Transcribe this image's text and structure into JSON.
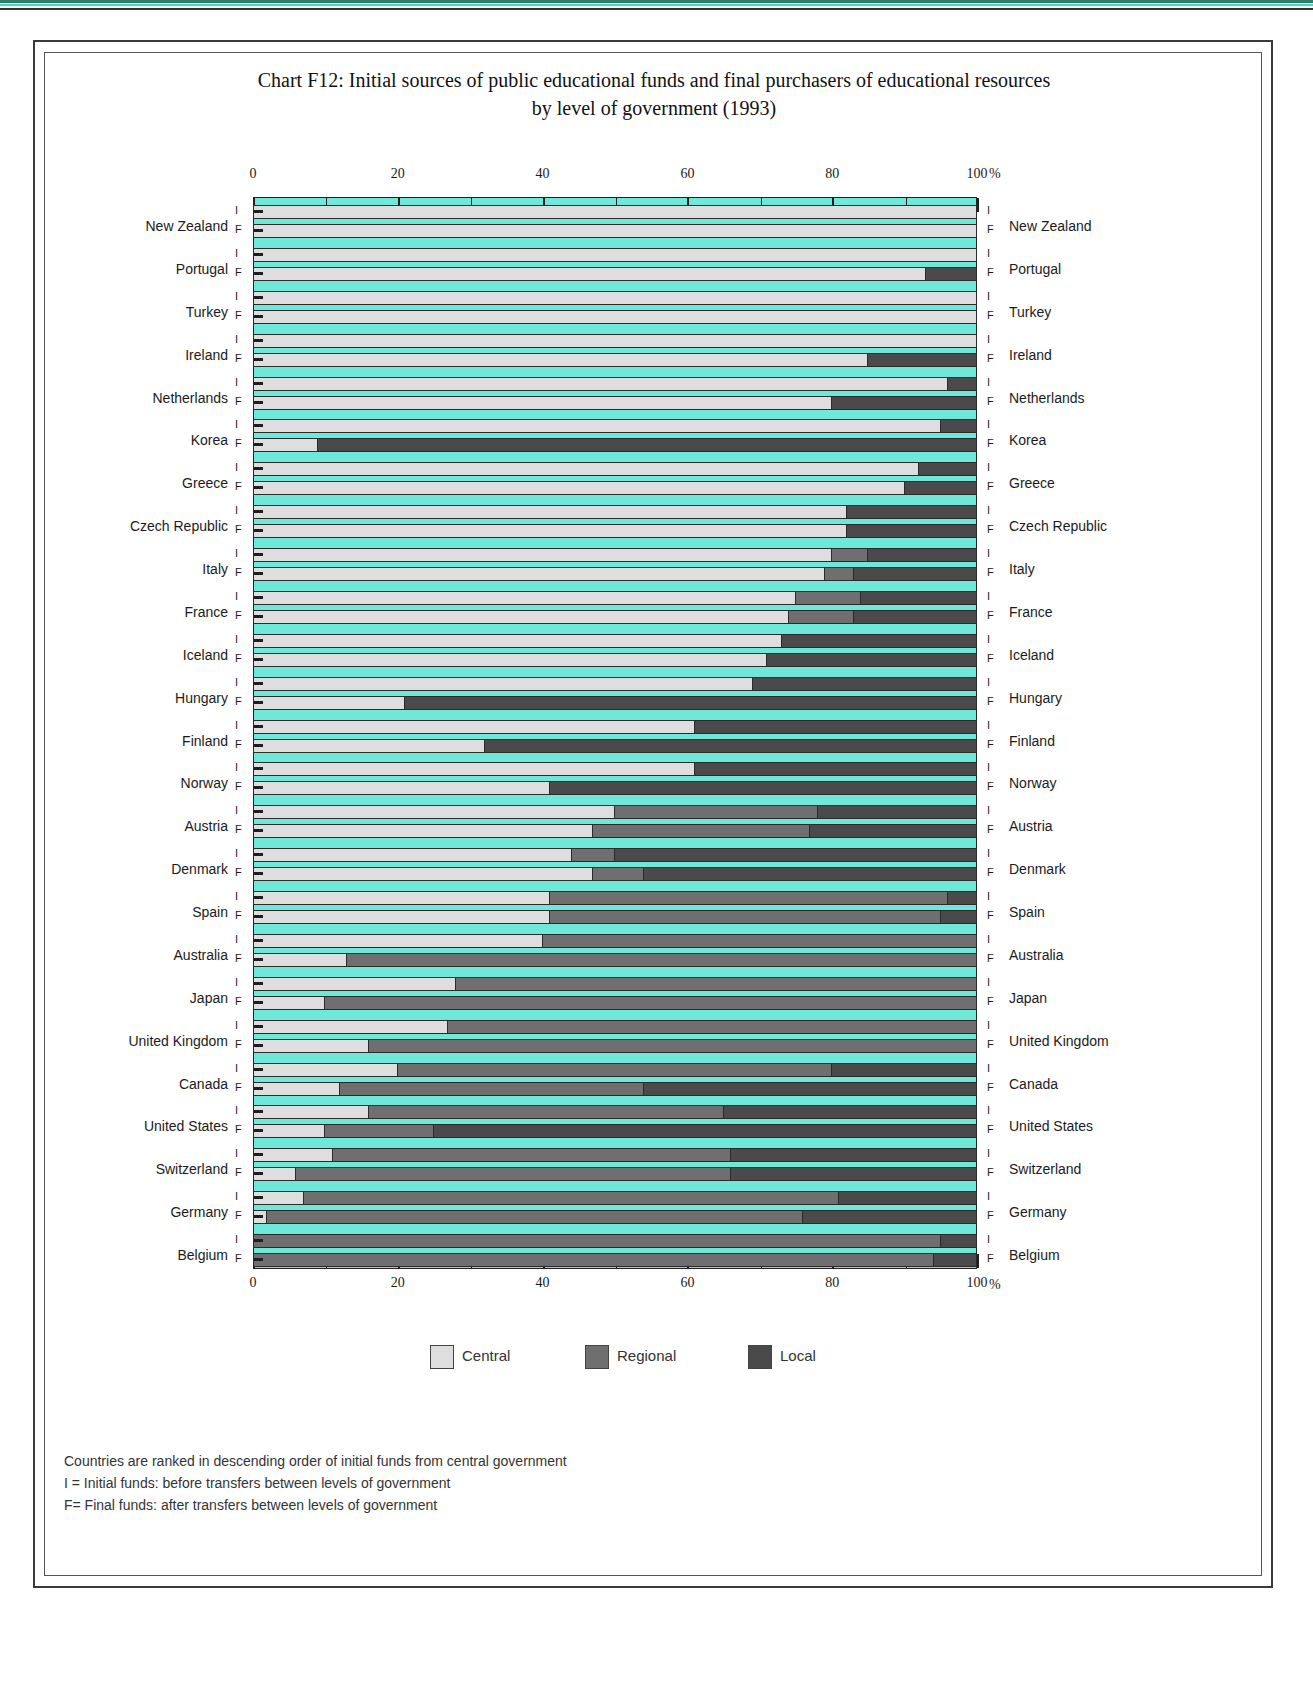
{
  "title_line1": "Chart F12: Initial sources of public educational funds and final purchasers of educational resources",
  "title_line2": "by level of government (1993)",
  "axis": {
    "ticks": [
      0,
      20,
      40,
      60,
      80,
      100
    ],
    "minor_ticks": [
      10,
      30,
      50,
      70,
      90
    ],
    "unit": "%",
    "min": 0,
    "max": 100
  },
  "legend": {
    "items": [
      {
        "label": "Central",
        "color": "#dedede"
      },
      {
        "label": "Regional",
        "color": "#6f6f6f"
      },
      {
        "label": "Local",
        "color": "#4a4a4a"
      }
    ]
  },
  "row_markers": {
    "initial": "I",
    "final": "F"
  },
  "notes": [
    "Countries are ranked in descending order of initial funds from central government",
    "I = Initial funds: before transfers between levels of government",
    "F= Final funds: after transfers between levels of government"
  ],
  "chart_data": {
    "type": "bar",
    "orientation": "horizontal",
    "stacked": true,
    "title": "Chart F12: Initial sources of public educational funds and final purchasers of educational resources by level of government (1993)",
    "xlabel": "%",
    "ylabel": "",
    "xlim": [
      0,
      100
    ],
    "grid": false,
    "legend_position": "bottom",
    "series": [
      {
        "name": "Central",
        "color": "#dedede"
      },
      {
        "name": "Regional",
        "color": "#6f6f6f"
      },
      {
        "name": "Local",
        "color": "#4a4a4a"
      }
    ],
    "categories": [
      "New Zealand",
      "Portugal",
      "Turkey",
      "Ireland",
      "Netherlands",
      "Korea",
      "Greece",
      "Czech Republic",
      "Italy",
      "France",
      "Iceland",
      "Hungary",
      "Finland",
      "Norway",
      "Austria",
      "Denmark",
      "Spain",
      "Australia",
      "Japan",
      "United Kingdom",
      "Canada",
      "United States",
      "Switzerland",
      "Germany",
      "Belgium"
    ],
    "rows": [
      {
        "country": "New Zealand",
        "initial": {
          "central": 100,
          "regional": 0,
          "local": 0
        },
        "final": {
          "central": 100,
          "regional": 0,
          "local": 0
        }
      },
      {
        "country": "Portugal",
        "initial": {
          "central": 100,
          "regional": 0,
          "local": 0
        },
        "final": {
          "central": 93,
          "regional": 0,
          "local": 7
        }
      },
      {
        "country": "Turkey",
        "initial": {
          "central": 100,
          "regional": 0,
          "local": 0
        },
        "final": {
          "central": 100,
          "regional": 0,
          "local": 0
        }
      },
      {
        "country": "Ireland",
        "initial": {
          "central": 100,
          "regional": 0,
          "local": 0
        },
        "final": {
          "central": 85,
          "regional": 0,
          "local": 15
        }
      },
      {
        "country": "Netherlands",
        "initial": {
          "central": 96,
          "regional": 0,
          "local": 4
        },
        "final": {
          "central": 80,
          "regional": 0,
          "local": 20
        }
      },
      {
        "country": "Korea",
        "initial": {
          "central": 95,
          "regional": 0,
          "local": 5
        },
        "final": {
          "central": 9,
          "regional": 0,
          "local": 91
        }
      },
      {
        "country": "Greece",
        "initial": {
          "central": 92,
          "regional": 0,
          "local": 8
        },
        "final": {
          "central": 90,
          "regional": 0,
          "local": 10
        }
      },
      {
        "country": "Czech Republic",
        "initial": {
          "central": 82,
          "regional": 0,
          "local": 18
        },
        "final": {
          "central": 82,
          "regional": 0,
          "local": 18
        }
      },
      {
        "country": "Italy",
        "initial": {
          "central": 80,
          "regional": 5,
          "local": 15
        },
        "final": {
          "central": 79,
          "regional": 4,
          "local": 17
        }
      },
      {
        "country": "France",
        "initial": {
          "central": 75,
          "regional": 9,
          "local": 16
        },
        "final": {
          "central": 74,
          "regional": 9,
          "local": 17
        }
      },
      {
        "country": "Iceland",
        "initial": {
          "central": 73,
          "regional": 0,
          "local": 27
        },
        "final": {
          "central": 71,
          "regional": 0,
          "local": 29
        }
      },
      {
        "country": "Hungary",
        "initial": {
          "central": 69,
          "regional": 0,
          "local": 31
        },
        "final": {
          "central": 21,
          "regional": 0,
          "local": 79
        }
      },
      {
        "country": "Finland",
        "initial": {
          "central": 61,
          "regional": 0,
          "local": 39
        },
        "final": {
          "central": 32,
          "regional": 0,
          "local": 68
        }
      },
      {
        "country": "Norway",
        "initial": {
          "central": 61,
          "regional": 0,
          "local": 39
        },
        "final": {
          "central": 41,
          "regional": 0,
          "local": 59
        }
      },
      {
        "country": "Austria",
        "initial": {
          "central": 50,
          "regional": 28,
          "local": 22
        },
        "final": {
          "central": 47,
          "regional": 30,
          "local": 23
        }
      },
      {
        "country": "Denmark",
        "initial": {
          "central": 44,
          "regional": 6,
          "local": 50
        },
        "final": {
          "central": 47,
          "regional": 7,
          "local": 46
        }
      },
      {
        "country": "Spain",
        "initial": {
          "central": 41,
          "regional": 55,
          "local": 4
        },
        "final": {
          "central": 41,
          "regional": 54,
          "local": 5
        }
      },
      {
        "country": "Australia",
        "initial": {
          "central": 40,
          "regional": 60,
          "local": 0
        },
        "final": {
          "central": 13,
          "regional": 87,
          "local": 0
        }
      },
      {
        "country": "Japan",
        "initial": {
          "central": 28,
          "regional": 72,
          "local": 0
        },
        "final": {
          "central": 10,
          "regional": 90,
          "local": 0
        }
      },
      {
        "country": "United Kingdom",
        "initial": {
          "central": 27,
          "regional": 73,
          "local": 0
        },
        "final": {
          "central": 16,
          "regional": 84,
          "local": 0
        }
      },
      {
        "country": "Canada",
        "initial": {
          "central": 20,
          "regional": 60,
          "local": 20
        },
        "final": {
          "central": 12,
          "regional": 42,
          "local": 46
        }
      },
      {
        "country": "United States",
        "initial": {
          "central": 16,
          "regional": 49,
          "local": 35
        },
        "final": {
          "central": 10,
          "regional": 15,
          "local": 75
        }
      },
      {
        "country": "Switzerland",
        "initial": {
          "central": 11,
          "regional": 55,
          "local": 34
        },
        "final": {
          "central": 6,
          "regional": 60,
          "local": 34
        }
      },
      {
        "country": "Germany",
        "initial": {
          "central": 7,
          "regional": 74,
          "local": 19
        },
        "final": {
          "central": 2,
          "regional": 74,
          "local": 24
        }
      },
      {
        "country": "Belgium",
        "initial": {
          "central": 0,
          "regional": 95,
          "local": 5
        },
        "final": {
          "central": 0,
          "regional": 94,
          "local": 6
        }
      }
    ]
  }
}
